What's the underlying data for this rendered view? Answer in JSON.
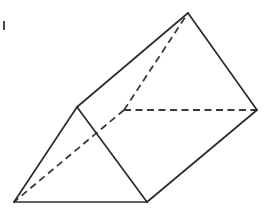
{
  "figure": {
    "shape_name": "triangular-prism",
    "background_color": "#ffffff",
    "solid_edge_color": "#2b2b2b",
    "hidden_edge_color": "#3a3a3a",
    "solid_edge_width": 1.7,
    "hidden_edge_width": 1.8,
    "hidden_edge_dash": "7 4.5",
    "canvas": {
      "width": 275,
      "height": 215
    },
    "vertices": {
      "front_apex": {
        "id": "A",
        "x": 77,
        "y": 107,
        "label": "front-top-apex",
        "visible": true
      },
      "front_bottom_left": {
        "id": "B",
        "x": 14,
        "y": 202,
        "label": "front-bottom-left",
        "visible": true
      },
      "front_bottom_right": {
        "id": "C",
        "x": 147,
        "y": 202,
        "label": "front-bottom-right",
        "visible": true
      },
      "back_apex": {
        "id": "D",
        "x": 188,
        "y": 13,
        "label": "back-top-apex",
        "visible": true
      },
      "back_hidden": {
        "id": "E",
        "x": 124,
        "y": 110,
        "label": "back-hidden-vertex",
        "visible": false
      },
      "back_right": {
        "id": "F",
        "x": 257,
        "y": 110,
        "label": "back-right-vertex",
        "visible": true
      }
    },
    "solid_edges": [
      {
        "name": "front-left-edge",
        "from": "A",
        "to": "B",
        "path": "M 77 107 L 14 202"
      },
      {
        "name": "front-right-edge",
        "from": "A",
        "to": "C",
        "path": "M 77 107 L 147 202"
      },
      {
        "name": "front-bottom-edge",
        "from": "B",
        "to": "C",
        "path": "M 14 202 L 147 202"
      },
      {
        "name": "top-ridge-edge",
        "from": "A",
        "to": "D",
        "path": "M 77 107 L 188 13"
      },
      {
        "name": "back-right-upper-edge",
        "from": "D",
        "to": "F",
        "path": "M 188 13 L 257 110"
      },
      {
        "name": "bottom-right-long-edge",
        "from": "C",
        "to": "F",
        "path": "M 147 202 L 257 110"
      }
    ],
    "hidden_edges": [
      {
        "name": "hidden-back-left-edge",
        "from": "E",
        "to": "D",
        "path": "M 124 110 L 188 13"
      },
      {
        "name": "hidden-back-bottom-edge",
        "from": "E",
        "to": "F",
        "path": "M 124 110 L 257 110"
      },
      {
        "name": "hidden-long-edge",
        "from": "E",
        "to": "B",
        "path": "M 124 110 L 14 202"
      }
    ],
    "faces": [
      {
        "name": "front-triangular-face",
        "points": "77,107 14,202 147,202"
      },
      {
        "name": "top-rectangular-face",
        "points": "77,107 188,13 257,110 147,202"
      }
    ],
    "artifact": {
      "name": "ink-speck",
      "x": 3,
      "y": 21,
      "width": 2,
      "height": 9
    }
  }
}
